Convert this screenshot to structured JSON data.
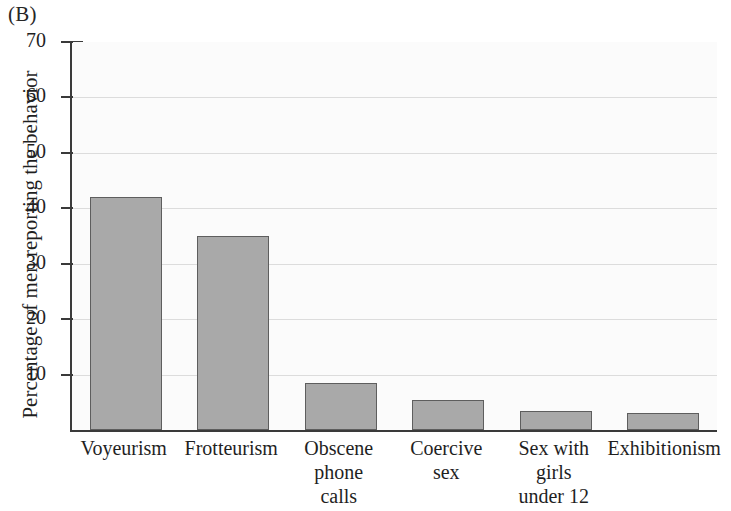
{
  "panel": {
    "label": "(B)"
  },
  "chart_data": {
    "type": "bar",
    "title": "",
    "xlabel": "",
    "ylabel": "Percentage of men reporting the behavior",
    "categories": [
      "Voyeurism",
      "Frotteurism",
      "Obscene phone calls",
      "Coercive sex",
      "Sex with girls under 12",
      "Exhibitionism"
    ],
    "category_lines": [
      [
        "Voyeurism"
      ],
      [
        "Frotteurism"
      ],
      [
        "Obscene",
        "phone",
        "calls"
      ],
      [
        "Coercive",
        "sex"
      ],
      [
        "Sex with",
        "girls",
        "under 12"
      ],
      [
        "Exhibitionism"
      ]
    ],
    "values": [
      42,
      35,
      8.5,
      5.5,
      3.5,
      3
    ],
    "ylim": [
      0,
      70
    ],
    "ytick_labels": [
      "70",
      "60",
      "50",
      "40",
      "30",
      "20",
      "10"
    ],
    "ytick_values": [
      70,
      60,
      50,
      40,
      30,
      20,
      10
    ],
    "grid": true,
    "legend": "none",
    "bar_fill_color": "#a9a9a9",
    "bar_edge_color": "#5e5e5e",
    "axis_color": "#3a3a3a",
    "gridline_color": "#dcdcdc",
    "plot_background": "#fbfbfb"
  }
}
